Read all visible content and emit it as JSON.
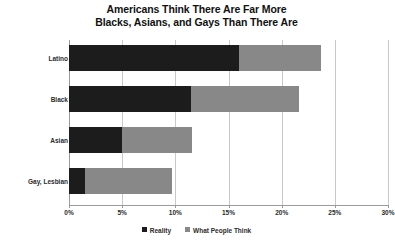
{
  "chart_data": {
    "type": "bar",
    "subtype": "stacked-horizontal",
    "title": "Americans Think There Are Far More Blacks, Asians, and Gays Than There Are",
    "title_lines": [
      "Americans Think There Are Far More",
      "Blacks, Asians, and Gays Than There Are"
    ],
    "categories": [
      "Latino",
      "Black",
      "Asian",
      "Gay, Lesbian"
    ],
    "series": [
      {
        "name": "Reality",
        "color": "#1c1c1c",
        "values": [
          16.0,
          11.5,
          5.0,
          1.5
        ]
      },
      {
        "name": "What People Think",
        "color": "#888888",
        "values": [
          7.7,
          10.1,
          6.6,
          8.2
        ]
      }
    ],
    "totals": [
      23.7,
      21.6,
      11.6,
      9.7
    ],
    "xlabel": "",
    "ylabel": "",
    "xlim": [
      0,
      30
    ],
    "xticks": [
      0,
      5,
      10,
      15,
      20,
      25,
      30
    ],
    "xtick_labels": [
      "0%",
      "5%",
      "10%",
      "15%",
      "20%",
      "25%",
      "30%"
    ],
    "grid": true,
    "grid_axis": "x",
    "legend_position": "bottom",
    "legend": [
      "Reality",
      "What People Think"
    ],
    "value_format": "percent"
  }
}
